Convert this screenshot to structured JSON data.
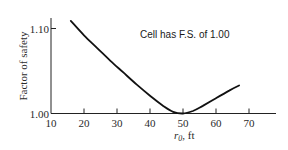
{
  "chart_data": {
    "type": "line",
    "title": "",
    "xlabel": "r0, ft",
    "xlabel_main": "r",
    "xlabel_sub": "0",
    "xlabel_unit": ", ft",
    "ylabel": "Factor of safety",
    "xlim": [
      10,
      77
    ],
    "ylim": [
      1.0,
      1.12
    ],
    "x_ticks": [
      10,
      20,
      30,
      40,
      50,
      60,
      70
    ],
    "x_tick_labels": [
      "10",
      "20",
      "30",
      "40",
      "50",
      "60",
      "70"
    ],
    "y_ticks": [
      1.0,
      1.1
    ],
    "y_tick_labels": [
      "1.00",
      "1.10"
    ],
    "grid": false,
    "legend": null,
    "annotations": [
      {
        "text": "Cell has F.S. of 1.00",
        "x": 48,
        "y": 1.085
      }
    ],
    "series": [
      {
        "name": "Factor of safety vs r0",
        "x": [
          16,
          20,
          24,
          28,
          32,
          36,
          40,
          44,
          47,
          50,
          53,
          56,
          60,
          64,
          67
        ],
        "y": [
          1.109,
          1.092,
          1.077,
          1.062,
          1.048,
          1.034,
          1.021,
          1.009,
          1.002,
          1.0,
          1.003,
          1.009,
          1.018,
          1.027,
          1.033
        ]
      }
    ]
  }
}
